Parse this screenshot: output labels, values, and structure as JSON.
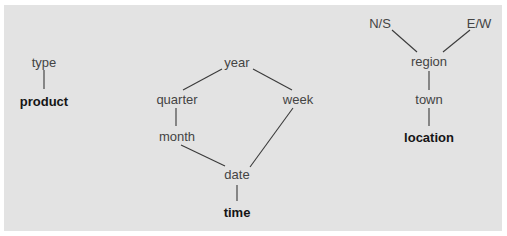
{
  "diagram": {
    "type": "concept-hierarchy-lattice",
    "colors": {
      "background": "#e3e3e3",
      "label": "#444444",
      "dimension_label": "#151515",
      "edge": "#3a3a3a"
    },
    "hierarchies": [
      {
        "dimension": "product",
        "nodes": [
          {
            "id": "type",
            "label": "type"
          },
          {
            "id": "product",
            "label": "product",
            "is_dimension": true
          }
        ],
        "edges": [
          [
            "type",
            "product"
          ]
        ]
      },
      {
        "dimension": "time",
        "nodes": [
          {
            "id": "year",
            "label": "year"
          },
          {
            "id": "quarter",
            "label": "quarter"
          },
          {
            "id": "week",
            "label": "week"
          },
          {
            "id": "month",
            "label": "month"
          },
          {
            "id": "date",
            "label": "date"
          },
          {
            "id": "time",
            "label": "time",
            "is_dimension": true
          }
        ],
        "edges": [
          [
            "year",
            "quarter"
          ],
          [
            "year",
            "week"
          ],
          [
            "quarter",
            "month"
          ],
          [
            "month",
            "date"
          ],
          [
            "week",
            "date"
          ],
          [
            "date",
            "time"
          ]
        ]
      },
      {
        "dimension": "location",
        "nodes": [
          {
            "id": "ns",
            "label": "N/S"
          },
          {
            "id": "ew",
            "label": "E/W"
          },
          {
            "id": "region",
            "label": "region"
          },
          {
            "id": "town",
            "label": "town"
          },
          {
            "id": "location",
            "label": "location",
            "is_dimension": true
          }
        ],
        "edges": [
          [
            "ns",
            "region"
          ],
          [
            "ew",
            "region"
          ],
          [
            "region",
            "town"
          ],
          [
            "town",
            "location"
          ]
        ]
      }
    ]
  }
}
